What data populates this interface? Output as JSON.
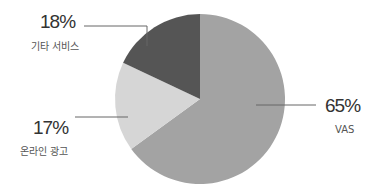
{
  "chart_data": {
    "type": "pie",
    "title": "",
    "start_angle": "12 o'clock, clockwise",
    "slices": [
      {
        "label": "VAS",
        "value": 65,
        "display": "65%",
        "color": "#a3a3a3"
      },
      {
        "label": "온라인 광고",
        "value": 17,
        "display": "17%",
        "color": "#d6d6d6"
      },
      {
        "label": "기타 서비스",
        "value": 18,
        "display": "18%",
        "color": "#555555"
      }
    ],
    "legend": "none (direct labels with leader lines)"
  },
  "labels": {
    "vas": {
      "pct": "65%",
      "name": "VAS"
    },
    "online_ads": {
      "pct": "17%",
      "name": "온라인 광고"
    },
    "other": {
      "pct": "18%",
      "name": "기타 서비스"
    }
  }
}
